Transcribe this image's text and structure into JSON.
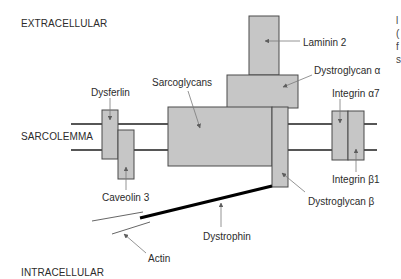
{
  "regions": {
    "extracellular": "EXTRACELLULAR",
    "sarcolemma": "SARCOLEMMA",
    "intracellular": "INTRACELLULAR"
  },
  "proteins": {
    "laminin": "Laminin 2",
    "dystroglycan_alpha": "Dystroglycan α",
    "sarcoglycans": "Sarcoglycans",
    "dysferlin": "Dysferlin",
    "integrin_alpha7": "Integrin α7",
    "caveolin": "Caveolin 3",
    "integrin_beta1": "Integrin β1",
    "dystroglycan_beta": "Dystroglycan β",
    "dystrophin": "Dystrophin",
    "actin": "Actin"
  },
  "clipped_margin_text": [
    "l",
    "(",
    "f",
    "s"
  ],
  "colors": {
    "box_fill": "#c6c6c6",
    "box_stroke": "#4a4a4a",
    "membrane": "#1e1e1e",
    "arrow": "#7a7a7a",
    "dystrophin": "#000000",
    "text": "#2b2b2b"
  }
}
